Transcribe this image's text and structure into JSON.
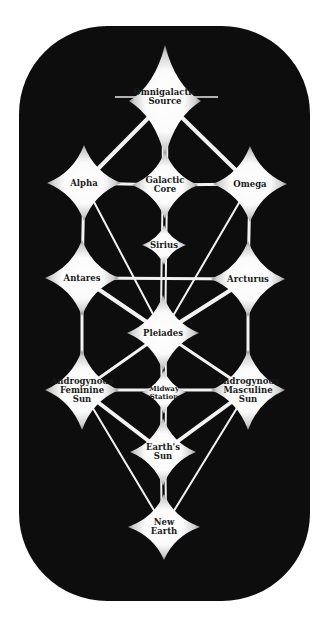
{
  "diagram": {
    "type": "tree-of-life network",
    "background": "#0d0d0d",
    "node_fill": "#ffffff",
    "edge_color": "#f2f2f2",
    "nodes": [
      {
        "id": "omnigalactic",
        "label": "Omnigalactic\nSource",
        "x": 165,
        "y": 101,
        "rx": 36,
        "ry": 56,
        "small": false
      },
      {
        "id": "alpha",
        "label": "Alpha",
        "x": 84,
        "y": 183,
        "rx": 37,
        "ry": 38,
        "small": false
      },
      {
        "id": "galactic-core",
        "label": "Galactic\nCore",
        "x": 165,
        "y": 185,
        "rx": 33,
        "ry": 34,
        "small": false
      },
      {
        "id": "omega",
        "label": "Omega",
        "x": 250,
        "y": 184,
        "rx": 37,
        "ry": 38,
        "small": false
      },
      {
        "id": "sirius",
        "label": "Sirius",
        "x": 164,
        "y": 245,
        "rx": 22,
        "ry": 20,
        "small": false
      },
      {
        "id": "antares",
        "label": "Antares",
        "x": 82,
        "y": 278,
        "rx": 37,
        "ry": 38,
        "small": false
      },
      {
        "id": "arcturus",
        "label": "Arcturus",
        "x": 248,
        "y": 279,
        "rx": 37,
        "ry": 38,
        "small": false
      },
      {
        "id": "pleiades",
        "label": "Pleiades",
        "x": 163,
        "y": 333,
        "rx": 36,
        "ry": 38,
        "small": false
      },
      {
        "id": "fem-sun",
        "label": "Androgynous\nFeminine\nSun",
        "x": 82,
        "y": 390,
        "rx": 37,
        "ry": 40,
        "small": false
      },
      {
        "id": "midway",
        "label": "Midway\nStation",
        "x": 164,
        "y": 392,
        "rx": 22,
        "ry": 22,
        "small": true
      },
      {
        "id": "masc-sun",
        "label": "Androgynous\nMasculine\nSun",
        "x": 248,
        "y": 390,
        "rx": 37,
        "ry": 40,
        "small": false
      },
      {
        "id": "earths-sun",
        "label": "Earth's\nSun",
        "x": 163,
        "y": 452,
        "rx": 33,
        "ry": 34,
        "small": false
      },
      {
        "id": "new-earth",
        "label": "New\nEarth",
        "x": 164,
        "y": 527,
        "rx": 36,
        "ry": 33,
        "small": false
      }
    ],
    "edges": [
      {
        "from": "omnigalactic",
        "to": "alpha",
        "w": 4
      },
      {
        "from": "omnigalactic",
        "to": "omega",
        "w": 4
      },
      {
        "from": "omnigalactic",
        "to": "galactic-core",
        "w": 2,
        "double": true
      },
      {
        "from": "alpha",
        "to": "galactic-core",
        "w": 3
      },
      {
        "from": "galactic-core",
        "to": "omega",
        "w": 3
      },
      {
        "from": "alpha",
        "to": "antares",
        "w": 3
      },
      {
        "from": "omega",
        "to": "arcturus",
        "w": 3
      },
      {
        "from": "alpha",
        "to": "pleiades",
        "w": 2
      },
      {
        "from": "omega",
        "to": "pleiades",
        "w": 2
      },
      {
        "from": "galactic-core",
        "to": "sirius",
        "w": 2,
        "double": true
      },
      {
        "from": "sirius",
        "to": "pleiades",
        "w": 2,
        "double": true
      },
      {
        "from": "antares",
        "to": "arcturus",
        "w": 3
      },
      {
        "from": "antares",
        "to": "pleiades",
        "w": 4
      },
      {
        "from": "arcturus",
        "to": "pleiades",
        "w": 4
      },
      {
        "from": "antares",
        "to": "fem-sun",
        "w": 3
      },
      {
        "from": "arcturus",
        "to": "masc-sun",
        "w": 3
      },
      {
        "from": "pleiades",
        "to": "fem-sun",
        "w": 3
      },
      {
        "from": "pleiades",
        "to": "masc-sun",
        "w": 3
      },
      {
        "from": "pleiades",
        "to": "midway",
        "w": 2,
        "double": true
      },
      {
        "from": "fem-sun",
        "to": "masc-sun",
        "w": 3
      },
      {
        "from": "midway",
        "to": "earths-sun",
        "w": 2,
        "double": true
      },
      {
        "from": "fem-sun",
        "to": "earths-sun",
        "w": 4
      },
      {
        "from": "masc-sun",
        "to": "earths-sun",
        "w": 4
      },
      {
        "from": "fem-sun",
        "to": "new-earth",
        "w": 2
      },
      {
        "from": "masc-sun",
        "to": "new-earth",
        "w": 2
      },
      {
        "from": "earths-sun",
        "to": "new-earth",
        "w": 2,
        "double": true
      }
    ],
    "source_flare": {
      "x1": 115,
      "x2": 218,
      "y": 97
    }
  }
}
